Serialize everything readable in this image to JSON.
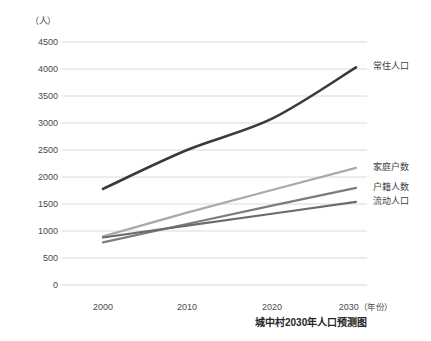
{
  "chart_data": {
    "type": "line",
    "title": "",
    "caption": "城中村2030年人口预测图",
    "xlabel": "年份",
    "ylabel": "人",
    "y_unit_label": "（人）",
    "x_unit_label": "（年份）",
    "x": [
      2000,
      2010,
      2020,
      2030
    ],
    "categories": [
      "2000",
      "2010",
      "2020",
      "2030"
    ],
    "xlim": [
      2000,
      2030
    ],
    "ylim": [
      0,
      4500
    ],
    "y_ticks": [
      4500,
      4000,
      3500,
      3000,
      2500,
      2000,
      1500,
      1000,
      500,
      0
    ],
    "y_tick_labels": [
      "4500",
      "4000",
      "3500",
      "3000",
      "2500",
      "2000",
      "1500",
      "1000",
      "500",
      "0"
    ],
    "x_ticks": [
      2000,
      2010,
      2020,
      2030
    ],
    "x_tick_labels": [
      "2000",
      "2010",
      "2020",
      "2030"
    ],
    "grid": true,
    "grid_axis": "y",
    "legend_position": "line-end-labels",
    "series": [
      {
        "name": "常住人口",
        "color": "#3a3a3a",
        "width": 2.6,
        "shape": "curved",
        "values": [
          1780,
          2500,
          3080,
          4030
        ]
      },
      {
        "name": "家庭户数",
        "color": "#a9a9a9",
        "width": 2.2,
        "shape": "straight",
        "values": [
          900,
          1340,
          1760,
          2170
        ]
      },
      {
        "name": "户籍人数",
        "color": "#7c7c7c",
        "width": 2.2,
        "shape": "straight",
        "values": [
          790,
          1130,
          1470,
          1800
        ]
      },
      {
        "name": "流动人口",
        "color": "#6b6b6b",
        "width": 2.2,
        "shape": "straight",
        "values": [
          880,
          1100,
          1320,
          1540
        ]
      }
    ]
  },
  "geometry": {
    "plot_left": 62,
    "plot_right": 367,
    "plot_top": 42,
    "plot_bottom": 285,
    "x_pos": [
      103,
      187,
      272,
      356
    ],
    "y_label_x": 18,
    "label_gap": 6
  },
  "colors": {
    "grid": "#d6d6d6",
    "axis_text": "#4a4a4a",
    "caption_text": "#262626"
  }
}
